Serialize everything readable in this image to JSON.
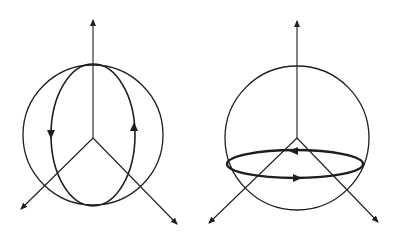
{
  "figure": {
    "panels": [
      {
        "name": "vertical-loop",
        "description": "Sphere with vertical elliptical circulation loop",
        "loop_direction": [
          "down on left",
          "up on right"
        ]
      },
      {
        "name": "horizontal-loop",
        "description": "Sphere with horizontal equatorial-plane circulation loop",
        "loop_direction": [
          "leftward on back",
          "rightward on front"
        ]
      }
    ],
    "colors": {
      "ink": "#1e1e1e",
      "background": "#ffffff"
    }
  }
}
